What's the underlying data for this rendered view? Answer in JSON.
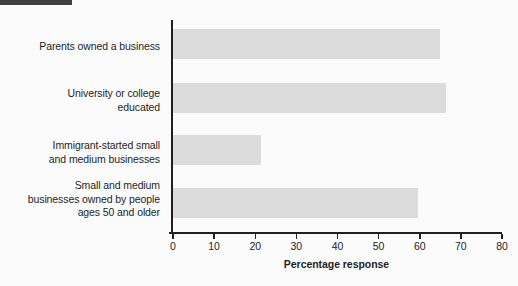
{
  "header": {
    "band_color": "#3f3f41"
  },
  "chart_data": {
    "type": "bar",
    "orientation": "horizontal",
    "title": "",
    "subtitle": "",
    "xlabel": "Percentage response",
    "ylabel": "",
    "xlim": [
      0,
      80
    ],
    "xticks": [
      0,
      10,
      20,
      30,
      40,
      50,
      60,
      70,
      80
    ],
    "xtick_labels": [
      "0",
      "10",
      "20",
      "30",
      "40",
      "50",
      "60",
      "70",
      "80"
    ],
    "grid": false,
    "legend": null,
    "bar_color": "#dcdcdc",
    "axis_color": "#231f20",
    "categories": [
      "Parents owned a business",
      "University or college educated",
      "Immigrant-started small and medium businesses",
      "Small and medium businesses owned by people ages 50 and older"
    ],
    "category_label_lines": [
      [
        "Parents owned a business"
      ],
      [
        "University or college",
        "educated"
      ],
      [
        "Immigrant-started small",
        "and medium businesses"
      ],
      [
        "Small and medium",
        "businesses owned by people",
        "ages 50 and older"
      ]
    ],
    "values": [
      65,
      66.5,
      21.5,
      59.5
    ],
    "series": [
      {
        "name": "Percentage response",
        "values": [
          65,
          66.5,
          21.5,
          59.5
        ]
      }
    ]
  }
}
